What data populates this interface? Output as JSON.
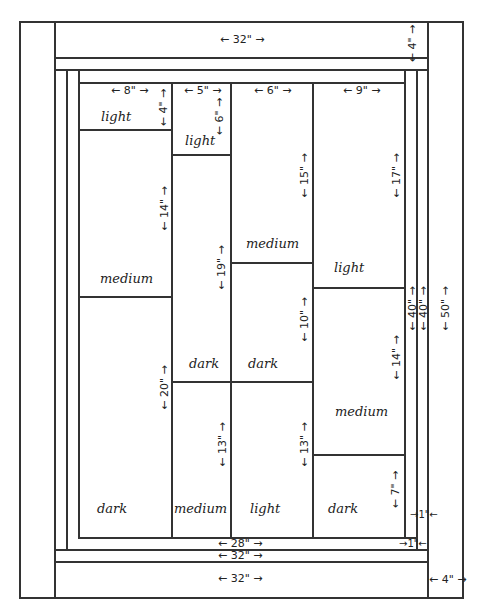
{
  "diagram": {
    "type": "quilt-layout",
    "borders": {
      "top_border_width": "← 32\" →",
      "top_border_height": "← 4\" →",
      "bottom_border_width": "← 32\" →",
      "inner_bottom_width_28": "← 28\" →",
      "inner_bottom_width_32": "← 32\" →",
      "right_border_width": "← 4\" →",
      "right_total_height": "← 50\" →",
      "strip_height_a": "← 40\" →",
      "strip_height_b": "← 40\" →",
      "strip_1in_a": "→1\"←",
      "strip_1in_b": "→1\"←"
    },
    "columns": [
      {
        "width_label": "← 8\" →",
        "blocks": [
          {
            "shade": "light",
            "height_label": "← 4\" →"
          },
          {
            "shade": "medium",
            "height_label": "← 14\" →"
          },
          {
            "shade": "dark",
            "height_label": "← 20\" →"
          }
        ]
      },
      {
        "width_label": "← 5\" →",
        "blocks": [
          {
            "shade": "light",
            "height_label": "← 6\" →"
          },
          {
            "shade": "dark",
            "height_label": "← 19\" →"
          },
          {
            "shade": "medium",
            "height_label": "← 13\" →"
          }
        ]
      },
      {
        "width_label": "← 6\" →",
        "blocks": [
          {
            "shade": "medium",
            "height_label": "← 15\" →"
          },
          {
            "shade": "dark",
            "height_label": "← 10\" →"
          },
          {
            "shade": "light",
            "height_label": "← 13\" →"
          }
        ]
      },
      {
        "width_label": "← 9\" →",
        "blocks": [
          {
            "shade": "light",
            "height_label": "← 17\" →"
          },
          {
            "shade": "medium",
            "height_label": "← 14\" →"
          },
          {
            "shade": "dark",
            "height_label": "← 7\" →"
          }
        ]
      }
    ]
  }
}
